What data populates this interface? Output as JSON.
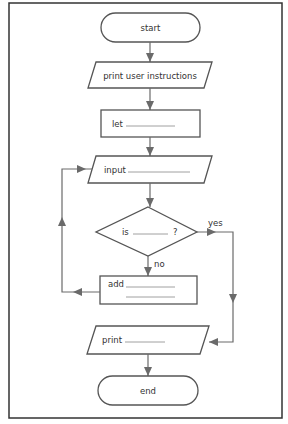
{
  "flowchart": {
    "nodes": [
      {
        "id": "start",
        "type": "terminal",
        "label": "start"
      },
      {
        "id": "instructions",
        "type": "io",
        "label": "print user instructions"
      },
      {
        "id": "let",
        "type": "process",
        "label": "let"
      },
      {
        "id": "input",
        "type": "io",
        "label": "input"
      },
      {
        "id": "decision",
        "type": "decision",
        "label": "is",
        "suffix": "?"
      },
      {
        "id": "add",
        "type": "process",
        "label": "add"
      },
      {
        "id": "print",
        "type": "io",
        "label": "print"
      },
      {
        "id": "end",
        "type": "terminal",
        "label": "end"
      }
    ],
    "edges": [
      {
        "from": "start",
        "to": "instructions"
      },
      {
        "from": "instructions",
        "to": "let"
      },
      {
        "from": "let",
        "to": "input"
      },
      {
        "from": "input",
        "to": "decision"
      },
      {
        "from": "decision",
        "to": "add",
        "label": "no"
      },
      {
        "from": "decision",
        "to": "print",
        "label": "yes"
      },
      {
        "from": "add",
        "to": "input"
      },
      {
        "from": "print",
        "to": "end"
      }
    ],
    "edge_labels": {
      "yes": "yes",
      "no": "no"
    }
  }
}
